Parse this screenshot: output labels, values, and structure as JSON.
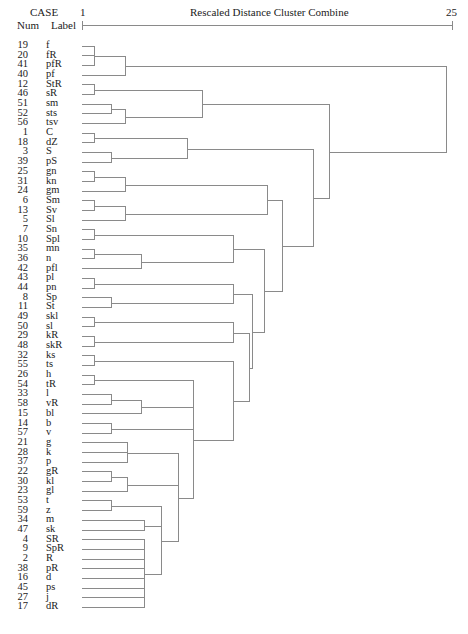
{
  "chart_data": {
    "type": "dendrogram",
    "title": "Rescaled Distance Cluster Combine",
    "header": {
      "case_label": "CASE",
      "num_label": "Num",
      "label_label": "Label"
    },
    "axis": {
      "min_label": "1",
      "max_label": "25",
      "min": 1,
      "max": 25
    },
    "leaves": [
      {
        "num": "19",
        "label": "f"
      },
      {
        "num": "20",
        "label": "fR"
      },
      {
        "num": "41",
        "label": "pfR"
      },
      {
        "num": "40",
        "label": "pf"
      },
      {
        "num": "12",
        "label": "StR"
      },
      {
        "num": "46",
        "label": "sR"
      },
      {
        "num": "51",
        "label": "sm"
      },
      {
        "num": "52",
        "label": "sts"
      },
      {
        "num": "56",
        "label": "tsv"
      },
      {
        "num": "1",
        "label": "C"
      },
      {
        "num": "18",
        "label": "dZ"
      },
      {
        "num": "3",
        "label": "S"
      },
      {
        "num": "39",
        "label": "pS"
      },
      {
        "num": "25",
        "label": "gn"
      },
      {
        "num": "31",
        "label": "kn"
      },
      {
        "num": "24",
        "label": "gm"
      },
      {
        "num": "6",
        "label": "Sm"
      },
      {
        "num": "13",
        "label": "Sv"
      },
      {
        "num": "5",
        "label": "Sl"
      },
      {
        "num": "7",
        "label": "Sn"
      },
      {
        "num": "10",
        "label": "Spl"
      },
      {
        "num": "35",
        "label": "mn"
      },
      {
        "num": "36",
        "label": "n"
      },
      {
        "num": "42",
        "label": "pfl"
      },
      {
        "num": "43",
        "label": "pl"
      },
      {
        "num": "44",
        "label": "pn"
      },
      {
        "num": "8",
        "label": "Sp"
      },
      {
        "num": "11",
        "label": "St"
      },
      {
        "num": "49",
        "label": "skl"
      },
      {
        "num": "50",
        "label": "sl"
      },
      {
        "num": "29",
        "label": "kR"
      },
      {
        "num": "48",
        "label": "skR"
      },
      {
        "num": "32",
        "label": "ks"
      },
      {
        "num": "55",
        "label": "ts"
      },
      {
        "num": "26",
        "label": "h"
      },
      {
        "num": "54",
        "label": "tR"
      },
      {
        "num": "33",
        "label": "l"
      },
      {
        "num": "58",
        "label": "vR"
      },
      {
        "num": "15",
        "label": "bl"
      },
      {
        "num": "14",
        "label": "b"
      },
      {
        "num": "57",
        "label": "v"
      },
      {
        "num": "21",
        "label": "g"
      },
      {
        "num": "28",
        "label": "k"
      },
      {
        "num": "37",
        "label": "p"
      },
      {
        "num": "22",
        "label": "gR"
      },
      {
        "num": "30",
        "label": "kl"
      },
      {
        "num": "23",
        "label": "gl"
      },
      {
        "num": "53",
        "label": "t"
      },
      {
        "num": "59",
        "label": "z"
      },
      {
        "num": "34",
        "label": "m"
      },
      {
        "num": "47",
        "label": "sk"
      },
      {
        "num": "4",
        "label": "SR"
      },
      {
        "num": "9",
        "label": "SpR"
      },
      {
        "num": "2",
        "label": "R"
      },
      {
        "num": "38",
        "label": "pR"
      },
      {
        "num": "16",
        "label": "d"
      },
      {
        "num": "45",
        "label": "ps"
      },
      {
        "num": "27",
        "label": "j"
      },
      {
        "num": "17",
        "label": "dR"
      }
    ],
    "merges_note": "Each merge: children are leaf indices (L#) or merge ids (M#); dist on 1-25 rescaled axis",
    "merges": [
      {
        "id": "M1",
        "children": [
          "L0",
          "L1",
          "L2"
        ],
        "dist": 1.8
      },
      {
        "id": "M2",
        "children": [
          "M1",
          "L3"
        ],
        "dist": 3.8
      },
      {
        "id": "M3",
        "children": [
          "L4",
          "L5"
        ],
        "dist": 1.8
      },
      {
        "id": "M4",
        "children": [
          "L6",
          "L7"
        ],
        "dist": 2.9
      },
      {
        "id": "M5",
        "children": [
          "M4",
          "L8"
        ],
        "dist": 3.8
      },
      {
        "id": "M6",
        "children": [
          "M3",
          "M5"
        ],
        "dist": 8.8
      },
      {
        "id": "M7",
        "children": [
          "L9",
          "L10"
        ],
        "dist": 1.8
      },
      {
        "id": "M8",
        "children": [
          "L11",
          "L12"
        ],
        "dist": 2.9
      },
      {
        "id": "M9",
        "children": [
          "M7",
          "M8"
        ],
        "dist": 7.8
      },
      {
        "id": "M10",
        "children": [
          "L13",
          "L14"
        ],
        "dist": 1.8
      },
      {
        "id": "M11",
        "children": [
          "M10",
          "L15"
        ],
        "dist": 3.8
      },
      {
        "id": "M12",
        "children": [
          "L16",
          "L17"
        ],
        "dist": 1.8
      },
      {
        "id": "M13",
        "children": [
          "M12",
          "L18"
        ],
        "dist": 3.8
      },
      {
        "id": "M14",
        "children": [
          "L19",
          "L20"
        ],
        "dist": 1.8
      },
      {
        "id": "M15",
        "children": [
          "L21",
          "L22"
        ],
        "dist": 1.8
      },
      {
        "id": "M16",
        "children": [
          "M15",
          "L23"
        ],
        "dist": 4.8
      },
      {
        "id": "M17",
        "children": [
          "M14",
          "M16"
        ],
        "dist": 10.8
      },
      {
        "id": "M18",
        "children": [
          "L24",
          "L25"
        ],
        "dist": 1.8
      },
      {
        "id": "M19",
        "children": [
          "L26",
          "L27"
        ],
        "dist": 2.9
      },
      {
        "id": "M20",
        "children": [
          "M18",
          "M19"
        ],
        "dist": 10.8
      },
      {
        "id": "M21",
        "children": [
          "L28",
          "L29"
        ],
        "dist": 1.8
      },
      {
        "id": "M22",
        "children": [
          "L30",
          "L31"
        ],
        "dist": 1.8
      },
      {
        "id": "M23",
        "children": [
          "M21",
          "M22"
        ],
        "dist": 10.8
      },
      {
        "id": "M24",
        "children": [
          "L32",
          "L33"
        ],
        "dist": 1.8
      },
      {
        "id": "M25",
        "children": [
          "L34",
          "L35"
        ],
        "dist": 1.8
      },
      {
        "id": "M26",
        "children": [
          "L36",
          "L37"
        ],
        "dist": 2.9
      },
      {
        "id": "M27",
        "children": [
          "M26",
          "L38"
        ],
        "dist": 4.8
      },
      {
        "id": "M28",
        "children": [
          "L39",
          "L40"
        ],
        "dist": 2.9
      },
      {
        "id": "M29",
        "children": [
          "L41",
          "L42",
          "L43"
        ],
        "dist": 3.9
      },
      {
        "id": "M30",
        "children": [
          "L44",
          "L45"
        ],
        "dist": 2.9
      },
      {
        "id": "M31",
        "children": [
          "M30",
          "L46"
        ],
        "dist": 3.9
      },
      {
        "id": "M32",
        "children": [
          "L47",
          "L48"
        ],
        "dist": 2.9
      },
      {
        "id": "M33",
        "children": [
          "L49",
          "L50"
        ],
        "dist": 5.0
      },
      {
        "id": "M34",
        "children": [
          "L51",
          "L52",
          "L53",
          "L54",
          "L55",
          "L56",
          "L57",
          "L58"
        ],
        "dist": 5.0
      },
      {
        "id": "M35",
        "children": [
          "M32",
          "M33",
          "M34"
        ],
        "dist": 6.1
      },
      {
        "id": "M36",
        "children": [
          "M29",
          "M31",
          "M35"
        ],
        "dist": 7.2
      },
      {
        "id": "M37",
        "children": [
          "M25",
          "M27",
          "M28",
          "M36"
        ],
        "dist": 8.2
      },
      {
        "id": "M38",
        "children": [
          "M24",
          "M37"
        ],
        "dist": 10.8
      },
      {
        "id": "M39",
        "children": [
          "M23",
          "M38"
        ],
        "dist": 11.8
      },
      {
        "id": "M40",
        "children": [
          "M20",
          "M39"
        ],
        "dist": 12.0
      },
      {
        "id": "M41",
        "children": [
          "M17",
          "M40"
        ],
        "dist": 12.8
      },
      {
        "id": "M42",
        "children": [
          "M11",
          "M13"
        ],
        "dist": 13.0
      },
      {
        "id": "M43",
        "children": [
          "M42",
          "M41"
        ],
        "dist": 14.0
      },
      {
        "id": "M44",
        "children": [
          "M9",
          "M43"
        ],
        "dist": 16.0
      },
      {
        "id": "M45",
        "children": [
          "M6",
          "M44"
        ],
        "dist": 17.0
      },
      {
        "id": "M46",
        "children": [
          "M2",
          "M45"
        ],
        "dist": 24.6
      }
    ],
    "colors": {
      "line": "#8a8a8a",
      "text": "#222222"
    }
  }
}
